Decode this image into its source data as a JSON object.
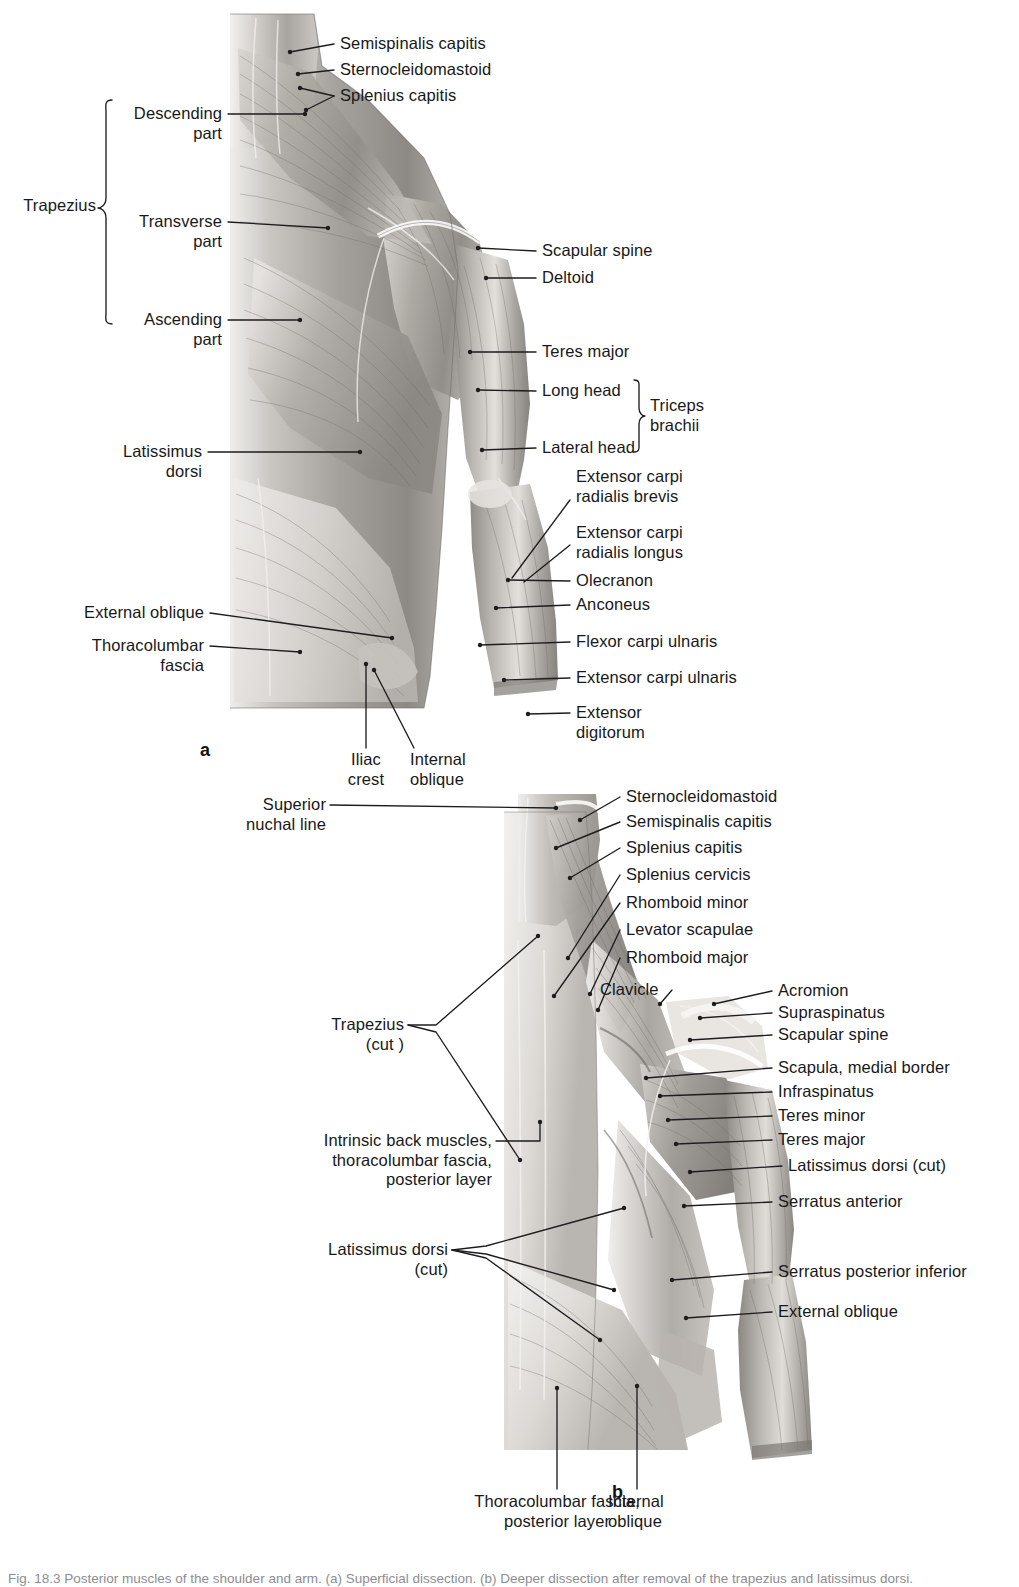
{
  "document": {
    "caption": "Fig. 18.3 Posterior muscles of the shoulder and arm. (a) Superficial dissection. (b) Deeper dissection after removal of the trapezius and latissimus dorsi.",
    "type": "anatomical-illustration",
    "colors": {
      "ink": "#18181a",
      "leader": "#1d1d1f",
      "caption": "#8d8d93",
      "background": "#ffffff"
    }
  },
  "figures": [
    {
      "id": "a",
      "letter": "a",
      "title": "Superficial dissection of posterior shoulder and arm",
      "bracket_groups": [
        {
          "label": "Trapezius",
          "members": [
            "Descending\npart",
            "Transverse\npart",
            "Ascending\npart"
          ]
        },
        {
          "label": "Triceps\nbrachii",
          "members": [
            "Long head",
            "Lateral head"
          ]
        }
      ],
      "labels": [
        {
          "key": "semispinalis-capitis",
          "text": "Semispinalis capitis",
          "side": "right"
        },
        {
          "key": "sternocleidomastoid",
          "text": "Sternocleidomastoid",
          "side": "right"
        },
        {
          "key": "splenius-capitis",
          "text": "Splenius capitis",
          "side": "right"
        },
        {
          "key": "trapezius",
          "text": "Trapezius",
          "side": "left"
        },
        {
          "key": "descending-part",
          "text": "Descending\npart",
          "side": "left"
        },
        {
          "key": "transverse-part",
          "text": "Transverse\npart",
          "side": "left"
        },
        {
          "key": "ascending-part",
          "text": "Ascending\npart",
          "side": "left"
        },
        {
          "key": "scapular-spine",
          "text": "Scapular spine",
          "side": "right"
        },
        {
          "key": "deltoid",
          "text": "Deltoid",
          "side": "right"
        },
        {
          "key": "teres-major",
          "text": "Teres major",
          "side": "right"
        },
        {
          "key": "long-head",
          "text": "Long head",
          "side": "right"
        },
        {
          "key": "lateral-head",
          "text": "Lateral head",
          "side": "right"
        },
        {
          "key": "triceps-brachii",
          "text": "Triceps\nbrachii",
          "side": "right"
        },
        {
          "key": "latissimus-dorsi",
          "text": "Latissimus\ndorsi",
          "side": "left"
        },
        {
          "key": "extensor-carpi-radialis-brevis",
          "text": "Extensor carpi\nradialis brevis",
          "side": "right"
        },
        {
          "key": "extensor-carpi-radialis-longus",
          "text": "Extensor carpi\nradialis longus",
          "side": "right"
        },
        {
          "key": "olecranon",
          "text": "Olecranon",
          "side": "right"
        },
        {
          "key": "anconeus",
          "text": "Anconeus",
          "side": "right"
        },
        {
          "key": "external-oblique",
          "text": "External oblique",
          "side": "left"
        },
        {
          "key": "thoracolumbar-fascia",
          "text": "Thoracolumbar\nfascia",
          "side": "left"
        },
        {
          "key": "flexor-carpi-ulnaris",
          "text": "Flexor carpi ulnaris",
          "side": "right"
        },
        {
          "key": "extensor-carpi-ulnaris",
          "text": "Extensor carpi ulnaris",
          "side": "right"
        },
        {
          "key": "extensor-digitorum",
          "text": "Extensor\ndigitorum",
          "side": "right"
        },
        {
          "key": "iliac-crest",
          "text": "Iliac\ncrest",
          "side": "bottom"
        },
        {
          "key": "internal-oblique",
          "text": "Internal\noblique",
          "side": "bottom"
        }
      ]
    },
    {
      "id": "b",
      "letter": "b",
      "title": "Deeper dissection of posterior shoulder and arm",
      "bracket_groups": [],
      "labels": [
        {
          "key": "superior-nuchal-line",
          "text": "Superior\nnuchal line",
          "side": "left"
        },
        {
          "key": "sternocleidomastoid",
          "text": "Sternocleidomastoid",
          "side": "right"
        },
        {
          "key": "semispinalis-capitis",
          "text": "Semispinalis capitis",
          "side": "right"
        },
        {
          "key": "splenius-capitis",
          "text": "Splenius capitis",
          "side": "right"
        },
        {
          "key": "splenius-cervicis",
          "text": "Splenius cervicis",
          "side": "right"
        },
        {
          "key": "rhomboid-minor",
          "text": "Rhomboid minor",
          "side": "right"
        },
        {
          "key": "levator-scapulae",
          "text": "Levator scapulae",
          "side": "right"
        },
        {
          "key": "rhomboid-major",
          "text": "Rhomboid major",
          "side": "right"
        },
        {
          "key": "clavicle",
          "text": "Clavicle",
          "side": "right"
        },
        {
          "key": "acromion",
          "text": "Acromion",
          "side": "right"
        },
        {
          "key": "supraspinatus",
          "text": "Supraspinatus",
          "side": "right"
        },
        {
          "key": "scapular-spine",
          "text": "Scapular spine",
          "side": "right"
        },
        {
          "key": "trapezius-cut",
          "text": "Trapezius\n(cut )",
          "side": "left"
        },
        {
          "key": "scapula-medial-border",
          "text": "Scapula, medial border",
          "side": "right"
        },
        {
          "key": "infraspinatus",
          "text": "Infraspinatus",
          "side": "right"
        },
        {
          "key": "teres-minor",
          "text": "Teres minor",
          "side": "right"
        },
        {
          "key": "teres-major",
          "text": "Teres major",
          "side": "right"
        },
        {
          "key": "latissimus-dorsi-cut-right",
          "text": "Latissimus dorsi (cut)",
          "side": "right"
        },
        {
          "key": "serratus-anterior",
          "text": "Serratus anterior",
          "side": "right"
        },
        {
          "key": "intrinsic-back-muscles",
          "text": "Intrinsic back muscles,\nthoracolumbar fascia,\nposterior layer",
          "side": "left"
        },
        {
          "key": "latissimus-dorsi-cut-left",
          "text": "Latissimus dorsi\n(cut)",
          "side": "left"
        },
        {
          "key": "serratus-posterior-inferior",
          "text": "Serratus posterior inferior",
          "side": "right"
        },
        {
          "key": "external-oblique",
          "text": "External oblique",
          "side": "right"
        },
        {
          "key": "thoracolumbar-fascia-posterior-layer",
          "text": "Thoracolumbar fascia,\nposterior layer",
          "side": "bottom"
        },
        {
          "key": "internal-oblique",
          "text": "Internal\noblique",
          "side": "bottom"
        }
      ]
    }
  ]
}
